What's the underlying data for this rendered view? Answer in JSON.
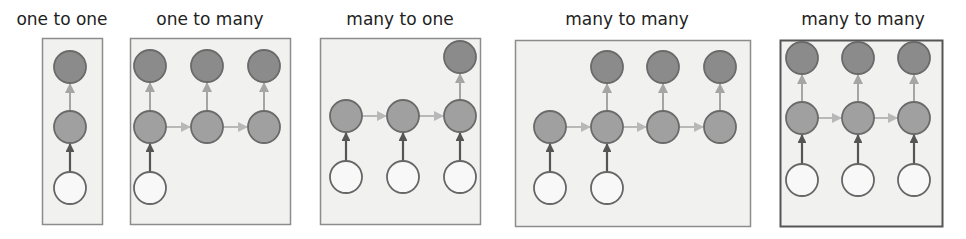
{
  "colors": {
    "panel_fill": "#f1f1f0",
    "panel_border": "#8c8c8c",
    "panel_border_last": "#555555",
    "output_fill": "#8b8b8b",
    "hidden_fill": "#a0a0a0",
    "node_stroke": "#6a6a6a",
    "input_fill": "#f8f8f8",
    "input_stroke": "#666666",
    "recurrent_arrow": "#b8b8b8",
    "input_arrow": "#555555",
    "output_arrow": "#a5a5a5"
  },
  "panels": [
    {
      "title": "one to one",
      "title_x": 62,
      "box": [
        42,
        38,
        60,
        186
      ],
      "border": "normal",
      "cols": [
        70
      ],
      "rows": {
        "out": 67,
        "hid": 127,
        "in": 188
      },
      "inputs": [
        0
      ],
      "outputs": [
        0
      ]
    },
    {
      "title": "one to many",
      "title_x": 210,
      "box": [
        130,
        38,
        160,
        186
      ],
      "border": "normal",
      "cols": [
        150,
        207,
        264
      ],
      "rows": {
        "out": 66,
        "hid": 127,
        "in": 188
      },
      "inputs": [
        0
      ],
      "outputs": [
        0,
        1,
        2
      ]
    },
    {
      "title": "many to one",
      "title_x": 400,
      "box": [
        320,
        38,
        160,
        186
      ],
      "border": "normal",
      "cols": [
        346,
        403,
        460
      ],
      "rows": {
        "out": 57,
        "hid": 116,
        "in": 177
      },
      "inputs": [
        0,
        1,
        2
      ],
      "outputs": [
        2
      ]
    },
    {
      "title": "many to many",
      "title_x": 627,
      "box": [
        515,
        40,
        235,
        186
      ],
      "border": "normal",
      "cols": [
        550,
        607,
        663,
        720
      ],
      "rows": {
        "out": 67,
        "hid": 127,
        "in": 188
      },
      "inputs": [
        0,
        1
      ],
      "outputs": [
        1,
        2,
        3
      ]
    },
    {
      "title": "many to many",
      "title_x": 863,
      "box": [
        780,
        40,
        162,
        186
      ],
      "border": "dark",
      "cols": [
        802,
        858,
        914
      ],
      "rows": {
        "out": 58,
        "hid": 118,
        "in": 180
      },
      "inputs": [
        0,
        1,
        2
      ],
      "outputs": [
        0,
        1,
        2
      ]
    }
  ],
  "node_radius": 16
}
